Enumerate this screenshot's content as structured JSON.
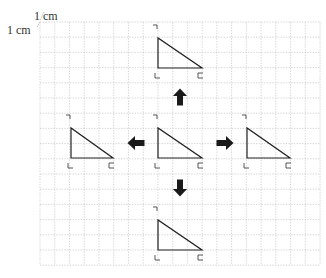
{
  "scale": {
    "horizontal_label": "1 cm",
    "vertical_label": "1 cm"
  },
  "grid": {
    "x0": 40,
    "y0": 22,
    "cols": 19,
    "rows": 16,
    "cell_w": 14.74,
    "cell_h": 15.2,
    "line_color": "#c8c8c8"
  },
  "shapes": {
    "stroke_color": "#222222",
    "arrow_color": "#1a1a1a",
    "triangles": [
      {
        "id": "top",
        "apex": [
          158,
          38
        ],
        "right_angle": [
          158,
          68
        ],
        "far": [
          202,
          68
        ]
      },
      {
        "id": "left",
        "apex": [
          71,
          128
        ],
        "right_angle": [
          71,
          158
        ],
        "far": [
          113,
          158
        ]
      },
      {
        "id": "center",
        "apex": [
          158,
          128
        ],
        "right_angle": [
          158,
          158
        ],
        "far": [
          202,
          158
        ]
      },
      {
        "id": "right",
        "apex": [
          247,
          128
        ],
        "right_angle": [
          247,
          158
        ],
        "far": [
          290,
          158
        ]
      },
      {
        "id": "bottom",
        "apex": [
          158,
          220
        ],
        "right_angle": [
          158,
          250
        ],
        "far": [
          202,
          250
        ]
      }
    ],
    "arrows": [
      {
        "id": "up",
        "direction": "up",
        "center": [
          180,
          97
        ]
      },
      {
        "id": "left",
        "direction": "left",
        "center": [
          136,
          143
        ]
      },
      {
        "id": "right",
        "direction": "right",
        "center": [
          225,
          143
        ]
      },
      {
        "id": "down",
        "direction": "down",
        "center": [
          180,
          188
        ]
      }
    ]
  }
}
